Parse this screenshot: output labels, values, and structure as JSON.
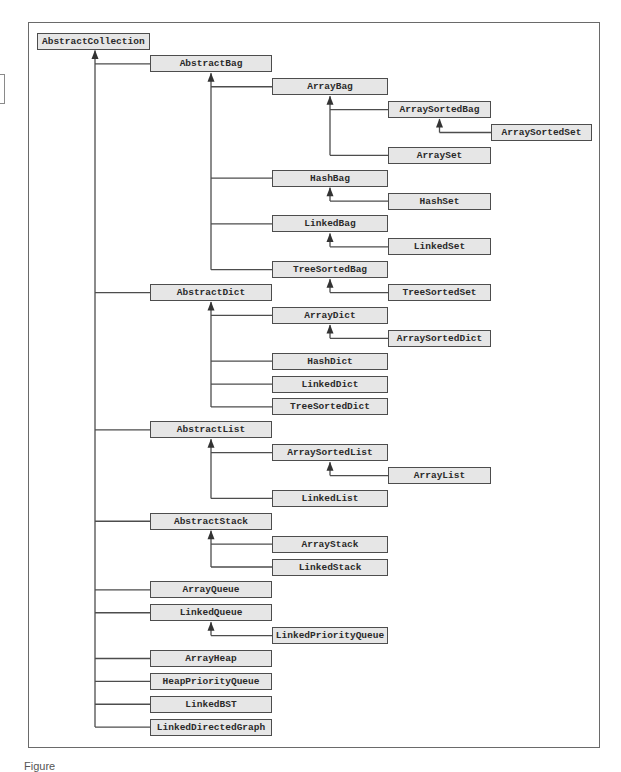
{
  "diagram": {
    "colors": {
      "box_fill": "#e6e6e6",
      "box_border": "#4d4d4d",
      "line": "#4d4d4d",
      "frame": "#6a6a6a",
      "text": "#2a2a2a"
    },
    "layout": {
      "row0_center_y": 41,
      "row_pitch": 22.87,
      "box_height": 17,
      "columns": [
        {
          "x": 37,
          "w": 113
        },
        {
          "x": 150,
          "w": 122
        },
        {
          "x": 272,
          "w": 116
        },
        {
          "x": 388,
          "w": 103
        },
        {
          "x": 491,
          "w": 101
        }
      ]
    },
    "nodes": [
      {
        "id": "AbstractCollection",
        "label": "AbstractCollection",
        "col": 0,
        "row": 0,
        "parent": null
      },
      {
        "id": "AbstractBag",
        "label": "AbstractBag",
        "col": 1,
        "row": 1,
        "parent": "AbstractCollection"
      },
      {
        "id": "ArrayBag",
        "label": "ArrayBag",
        "col": 2,
        "row": 2,
        "parent": "AbstractBag"
      },
      {
        "id": "ArraySortedBag",
        "label": "ArraySortedBag",
        "col": 3,
        "row": 3,
        "parent": "ArrayBag"
      },
      {
        "id": "ArraySortedSet",
        "label": "ArraySortedSet",
        "col": 4,
        "row": 4,
        "parent": "ArraySortedBag"
      },
      {
        "id": "ArraySet",
        "label": "ArraySet",
        "col": 3,
        "row": 5,
        "parent": "ArrayBag"
      },
      {
        "id": "HashBag",
        "label": "HashBag",
        "col": 2,
        "row": 6,
        "parent": "AbstractBag"
      },
      {
        "id": "HashSet",
        "label": "HashSet",
        "col": 3,
        "row": 7,
        "parent": "HashBag"
      },
      {
        "id": "LinkedBag",
        "label": "LinkedBag",
        "col": 2,
        "row": 8,
        "parent": "AbstractBag"
      },
      {
        "id": "LinkedSet",
        "label": "LinkedSet",
        "col": 3,
        "row": 9,
        "parent": "LinkedBag"
      },
      {
        "id": "TreeSortedBag",
        "label": "TreeSortedBag",
        "col": 2,
        "row": 10,
        "parent": "AbstractBag"
      },
      {
        "id": "TreeSortedSet",
        "label": "TreeSortedSet",
        "col": 3,
        "row": 11,
        "parent": "TreeSortedBag"
      },
      {
        "id": "AbstractDict",
        "label": "AbstractDict",
        "col": 1,
        "row": 11,
        "parent": "AbstractCollection"
      },
      {
        "id": "ArrayDict",
        "label": "ArrayDict",
        "col": 2,
        "row": 12,
        "parent": "AbstractDict"
      },
      {
        "id": "ArraySortedDict",
        "label": "ArraySortedDict",
        "col": 3,
        "row": 13,
        "parent": "ArrayDict"
      },
      {
        "id": "HashDict",
        "label": "HashDict",
        "col": 2,
        "row": 14,
        "parent": "AbstractDict"
      },
      {
        "id": "LinkedDict",
        "label": "LinkedDict",
        "col": 2,
        "row": 15,
        "parent": "AbstractDict"
      },
      {
        "id": "TreeSortedDict",
        "label": "TreeSortedDict",
        "col": 2,
        "row": 16,
        "parent": "AbstractDict"
      },
      {
        "id": "AbstractList",
        "label": "AbstractList",
        "col": 1,
        "row": 17,
        "parent": "AbstractCollection"
      },
      {
        "id": "ArraySortedList",
        "label": "ArraySortedList",
        "col": 2,
        "row": 18,
        "parent": "AbstractList"
      },
      {
        "id": "ArrayList",
        "label": "ArrayList",
        "col": 3,
        "row": 19,
        "parent": "ArraySortedList"
      },
      {
        "id": "LinkedList",
        "label": "LinkedList",
        "col": 2,
        "row": 20,
        "parent": "AbstractList"
      },
      {
        "id": "AbstractStack",
        "label": "AbstractStack",
        "col": 1,
        "row": 21,
        "parent": "AbstractCollection"
      },
      {
        "id": "ArrayStack",
        "label": "ArrayStack",
        "col": 2,
        "row": 22,
        "parent": "AbstractStack"
      },
      {
        "id": "LinkedStack",
        "label": "LinkedStack",
        "col": 2,
        "row": 23,
        "parent": "AbstractStack"
      },
      {
        "id": "ArrayQueue",
        "label": "ArrayQueue",
        "col": 1,
        "row": 24,
        "parent": "AbstractCollection"
      },
      {
        "id": "LinkedQueue",
        "label": "LinkedQueue",
        "col": 1,
        "row": 25,
        "parent": "AbstractCollection"
      },
      {
        "id": "LinkedPriorityQueue",
        "label": "LinkedPriorityQueue",
        "col": 2,
        "row": 26,
        "parent": "LinkedQueue"
      },
      {
        "id": "ArrayHeap",
        "label": "ArrayHeap",
        "col": 1,
        "row": 27,
        "parent": "AbstractCollection"
      },
      {
        "id": "HeapPriorityQueue",
        "label": "HeapPriorityQueue",
        "col": 1,
        "row": 28,
        "parent": "AbstractCollection"
      },
      {
        "id": "LinkedBST",
        "label": "LinkedBST",
        "col": 1,
        "row": 29,
        "parent": "AbstractCollection"
      },
      {
        "id": "LinkedDirectedGraph",
        "label": "LinkedDirectedGraph",
        "col": 1,
        "row": 30,
        "parent": "AbstractCollection"
      }
    ]
  },
  "caption": {
    "text": "Figure"
  }
}
